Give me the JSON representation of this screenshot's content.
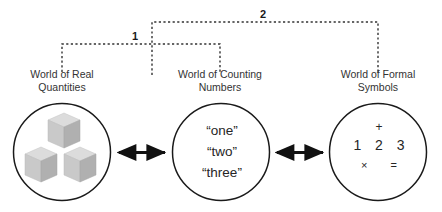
{
  "diagram": {
    "brackets": [
      {
        "id": "bracket-1",
        "label": "1"
      },
      {
        "id": "bracket-2",
        "label": "2"
      }
    ],
    "nodes": [
      {
        "id": "world-of-real-quantities",
        "caption": "World of Real\nQuantities",
        "content_type": "cubes",
        "cube_count": 3
      },
      {
        "id": "world-of-counting-numbers",
        "caption": "World of Counting\nNumbers",
        "content_type": "words",
        "words": [
          "“one”",
          "“two”",
          "“three”"
        ]
      },
      {
        "id": "world-of-formal-symbols",
        "caption": "World of Formal\nSymbols",
        "content_type": "symbols",
        "symbol_rows": [
          "+",
          "1 2 3",
          "× ="
        ]
      }
    ],
    "connectors": [
      {
        "id": "arrow-real-to-counting",
        "kind": "double-headed-arrow"
      },
      {
        "id": "arrow-counting-to-formal",
        "kind": "double-headed-arrow"
      }
    ],
    "colors": {
      "stroke": "#1a1a1a",
      "bracket": "#333333",
      "text": "#2b2b2b",
      "cube_front": "#c9c9c9",
      "cube_top": "#dedede",
      "cube_side": "#b3b3b3",
      "background": "#ffffff"
    }
  }
}
